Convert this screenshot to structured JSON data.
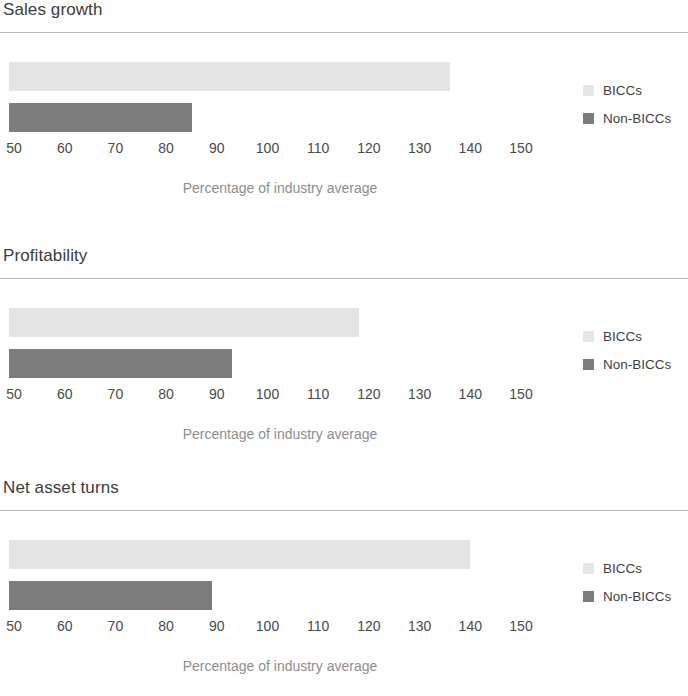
{
  "axis": {
    "caption": "Percentage of industry average",
    "ticks": [
      "50",
      "60",
      "70",
      "80",
      "90",
      "100",
      "110",
      "120",
      "130",
      "140",
      "150"
    ],
    "min": 50,
    "max": 150,
    "tick_step": 10
  },
  "legend": {
    "items": [
      {
        "label": "BICCs",
        "swatch": "light",
        "color": "#e6e6e6"
      },
      {
        "label": "Non-BICCs",
        "swatch": "dark",
        "color": "#7c7c7c"
      }
    ]
  },
  "panels": [
    {
      "title": "Sales growth"
    },
    {
      "title": "Profitability"
    },
    {
      "title": "Net asset turns"
    }
  ],
  "chart_data": [
    {
      "type": "bar",
      "orientation": "horizontal",
      "title": "Sales growth",
      "xlabel": "Percentage of industry average",
      "ylabel": "",
      "xlim": [
        50,
        150
      ],
      "grid": false,
      "legend_position": "right",
      "categories": [
        "BICCs",
        "Non-BICCs"
      ],
      "values": [
        137,
        86
      ]
    },
    {
      "type": "bar",
      "orientation": "horizontal",
      "title": "Profitability",
      "xlabel": "Percentage of industry average",
      "ylabel": "",
      "xlim": [
        50,
        150
      ],
      "grid": false,
      "legend_position": "right",
      "categories": [
        "BICCs",
        "Non-BICCs"
      ],
      "values": [
        119,
        94
      ]
    },
    {
      "type": "bar",
      "orientation": "horizontal",
      "title": "Net asset turns",
      "xlabel": "Percentage of industry average",
      "ylabel": "",
      "xlim": [
        50,
        150
      ],
      "grid": false,
      "legend_position": "right",
      "categories": [
        "BICCs",
        "Non-BICCs"
      ],
      "values": [
        141,
        90
      ]
    }
  ]
}
